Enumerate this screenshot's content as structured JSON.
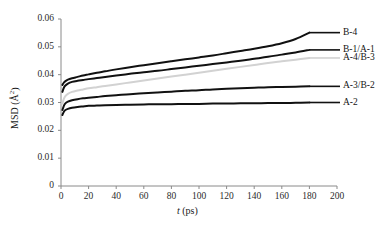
{
  "chart_data": {
    "type": "line",
    "title": "",
    "xlabel": "t (ps)",
    "ylabel": "MSD (Å²)",
    "xlim": [
      0,
      200
    ],
    "ylim": [
      0,
      0.06
    ],
    "grid": false,
    "legend_position": "right-inline-labels",
    "xticks": [
      "0",
      "20",
      "40",
      "60",
      "80",
      "100",
      "120",
      "140",
      "160",
      "180",
      "200"
    ],
    "xtick_values": [
      0,
      20,
      40,
      60,
      80,
      100,
      120,
      140,
      160,
      180,
      200
    ],
    "yticks": [
      "0",
      "0.01",
      "0.02",
      "0.03",
      "0.04",
      "0.05",
      "0.06"
    ],
    "ytick_values": [
      0,
      0.01,
      0.02,
      0.03,
      0.04,
      0.05,
      0.06
    ],
    "series": [
      {
        "name": "B-4",
        "color": "#111111",
        "width": 2.0,
        "x": [
          1,
          2,
          3,
          5,
          8,
          12,
          16,
          20,
          26,
          32,
          40,
          50,
          60,
          70,
          80,
          90,
          100,
          110,
          120,
          130,
          140,
          150,
          160,
          170,
          180
        ],
        "values": [
          0.0363,
          0.0371,
          0.0376,
          0.0382,
          0.0387,
          0.0392,
          0.0397,
          0.0401,
          0.0407,
          0.0412,
          0.0419,
          0.0427,
          0.0434,
          0.0441,
          0.0448,
          0.0455,
          0.0462,
          0.0469,
          0.0477,
          0.0485,
          0.0493,
          0.0502,
          0.0513,
          0.0528,
          0.0551
        ]
      },
      {
        "name": "B-1/A-1",
        "color": "#111111",
        "width": 2.0,
        "x": [
          1,
          2,
          3,
          5,
          8,
          12,
          16,
          20,
          26,
          32,
          40,
          50,
          60,
          70,
          80,
          90,
          100,
          110,
          120,
          130,
          140,
          150,
          160,
          170,
          180
        ],
        "values": [
          0.0338,
          0.0352,
          0.036,
          0.0368,
          0.0374,
          0.0378,
          0.0381,
          0.0384,
          0.0388,
          0.0392,
          0.0397,
          0.0403,
          0.0409,
          0.0414,
          0.042,
          0.0426,
          0.0432,
          0.0438,
          0.0444,
          0.045,
          0.0457,
          0.0464,
          0.0472,
          0.048,
          0.0489
        ]
      },
      {
        "name": "A-4/B-3",
        "color": "#d2d2d2",
        "width": 2.0,
        "x": [
          1,
          2,
          3,
          5,
          8,
          12,
          16,
          20,
          26,
          32,
          40,
          50,
          60,
          70,
          80,
          90,
          100,
          110,
          120,
          130,
          140,
          150,
          160,
          170,
          180
        ],
        "values": [
          0.0296,
          0.0312,
          0.0322,
          0.0331,
          0.0338,
          0.0343,
          0.0347,
          0.0351,
          0.0355,
          0.0359,
          0.0365,
          0.0372,
          0.0379,
          0.0386,
          0.0393,
          0.04,
          0.0407,
          0.0414,
          0.0421,
          0.0428,
          0.0435,
          0.0442,
          0.0448,
          0.0454,
          0.046
        ]
      },
      {
        "name": "A-3/B-2",
        "color": "#111111",
        "width": 2.0,
        "x": [
          1,
          2,
          3,
          5,
          8,
          12,
          16,
          20,
          26,
          32,
          40,
          50,
          60,
          70,
          80,
          90,
          100,
          110,
          120,
          130,
          140,
          150,
          160,
          170,
          180
        ],
        "values": [
          0.0273,
          0.0287,
          0.0296,
          0.0303,
          0.0308,
          0.0312,
          0.0315,
          0.0317,
          0.032,
          0.0323,
          0.0326,
          0.033,
          0.0333,
          0.0336,
          0.0339,
          0.0342,
          0.0344,
          0.0347,
          0.0349,
          0.0351,
          0.0353,
          0.0355,
          0.0356,
          0.0357,
          0.0358
        ]
      },
      {
        "name": "A-2",
        "color": "#111111",
        "width": 2.0,
        "x": [
          1,
          2,
          3,
          5,
          8,
          12,
          16,
          20,
          26,
          32,
          40,
          50,
          60,
          70,
          80,
          90,
          100,
          110,
          120,
          130,
          140,
          150,
          160,
          170,
          180
        ],
        "values": [
          0.0255,
          0.0266,
          0.0272,
          0.0277,
          0.0281,
          0.0284,
          0.0286,
          0.0288,
          0.0289,
          0.029,
          0.0291,
          0.0292,
          0.0293,
          0.0294,
          0.0294,
          0.0295,
          0.0295,
          0.0296,
          0.0296,
          0.0297,
          0.0297,
          0.0298,
          0.0298,
          0.0299,
          0.03
        ]
      }
    ],
    "series_labels": [
      {
        "text": "B-4",
        "anchor_value": 0.0551
      },
      {
        "text": "B-1/A-1",
        "anchor_value": 0.0489
      },
      {
        "text": "A-4/B-3",
        "anchor_value": 0.046
      },
      {
        "text": "A-3/B-2",
        "anchor_value": 0.0358
      },
      {
        "text": "A-2",
        "anchor_value": 0.03
      }
    ]
  },
  "axes": {
    "y_title_main": "MSD (Å",
    "y_title_sup": "2",
    "y_title_close": ")",
    "x_title_sym": "t",
    "x_title_unit": " (ps)"
  }
}
